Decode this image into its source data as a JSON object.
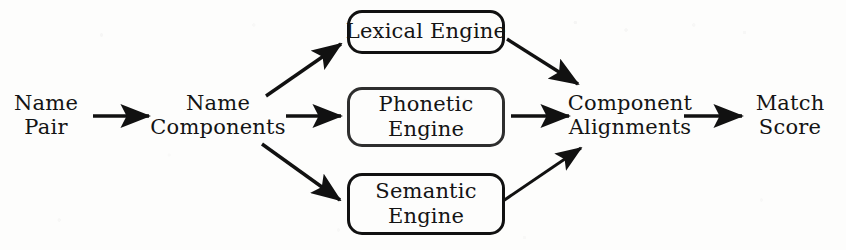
{
  "diagram": {
    "background_color": "#fdfdfc",
    "stroke_color": "#111111",
    "text_color": "#141414",
    "nodes": {
      "name_pair": {
        "line1": "Name",
        "line2": "Pair",
        "cx": 46,
        "cy": 115
      },
      "name_components": {
        "line1": "Name",
        "line2": "Components",
        "cx": 218,
        "cy": 115
      },
      "lexical_engine": {
        "line1": "Lexical Engine",
        "line2": "",
        "cx": 426,
        "cy": 32,
        "w": 158,
        "h": 44
      },
      "phonetic_engine": {
        "line1": "Phonetic",
        "line2": "Engine",
        "cx": 426,
        "cy": 117,
        "w": 158,
        "h": 60
      },
      "semantic_engine": {
        "line1": "Semantic",
        "line2": "Engine",
        "cx": 426,
        "cy": 204,
        "w": 158,
        "h": 62
      },
      "component_alignments": {
        "line1": "Component",
        "line2": "Alignments",
        "cx": 630,
        "cy": 115
      },
      "match_score": {
        "line1": "Match",
        "line2": "Score",
        "cx": 790,
        "cy": 115
      }
    },
    "edges": [
      {
        "id": "pair-to-components",
        "from": "name_pair",
        "to": "name_components",
        "x1": 93,
        "y1": 116,
        "x2": 152,
        "y2": 116
      },
      {
        "id": "components-to-lexical",
        "from": "name_components",
        "to": "lexical_engine",
        "x1": 266,
        "y1": 96,
        "x2": 344,
        "y2": 42
      },
      {
        "id": "components-to-phonetic",
        "from": "name_components",
        "to": "phonetic_engine",
        "x1": 286,
        "y1": 116,
        "x2": 344,
        "y2": 116
      },
      {
        "id": "components-to-semantic",
        "from": "name_components",
        "to": "semantic_engine",
        "x1": 262,
        "y1": 144,
        "x2": 343,
        "y2": 202
      },
      {
        "id": "lexical-to-alignments",
        "from": "lexical_engine",
        "to": "component_alignments",
        "x1": 507,
        "y1": 39,
        "x2": 581,
        "y2": 86
      },
      {
        "id": "phonetic-to-alignments",
        "from": "phonetic_engine",
        "to": "component_alignments",
        "x1": 511,
        "y1": 116,
        "x2": 572,
        "y2": 116
      },
      {
        "id": "semantic-to-alignments",
        "from": "semantic_engine",
        "to": "component_alignments",
        "x1": 503,
        "y1": 201,
        "x2": 584,
        "y2": 146
      },
      {
        "id": "alignments-to-score",
        "from": "component_alignments",
        "to": "match_score",
        "x1": 684,
        "y1": 116,
        "x2": 745,
        "y2": 116
      }
    ]
  }
}
